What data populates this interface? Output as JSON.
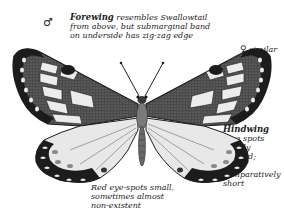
{
  "figure": {
    "symbols": {
      "male": "♂",
      "female": "♀"
    },
    "annotations": {
      "forewing": {
        "title": "Forewing",
        "line1": " resembles Swallowtail",
        "line2": "from above, but submarginal band",
        "line3": "on underside has zig-zag edge"
      },
      "female_note": {
        "symbol": "♀",
        "line1": " similar",
        "line2": "to ♂"
      },
      "hindwing": {
        "title": "Hindwing",
        "lines": [
          "blue spots",
          "clearly",
          "defined;",
          "tail is",
          "comparatively",
          "short"
        ]
      },
      "eyespots": {
        "lines": [
          "Red eye-spots small,",
          "sometimes almost",
          "non-existent"
        ]
      }
    },
    "colors": {
      "wing_black": "#1c1c1c",
      "wing_dark": "#3a3a3a",
      "wing_pale": "#ececec",
      "body": "#7a7a7a"
    }
  }
}
